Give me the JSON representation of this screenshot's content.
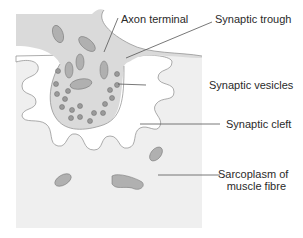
{
  "diagram": {
    "type": "neuromuscular-junction",
    "colors": {
      "background": "#ffffff",
      "muscle_fibre": "#efefef",
      "axon_terminal": "#dadada",
      "cleft": "#ffffff",
      "outline": "#8a8a8a",
      "mitochondrion": "#b0b0b0",
      "vesicle": "#9a9a9a",
      "leader_line": "#555555"
    },
    "labels": {
      "axon_terminal": "Axon terminal",
      "synaptic_trough": "Synaptic trough",
      "synaptic_vesicles": "Synaptic vesicles",
      "synaptic_cleft": "Synaptic cleft",
      "sarcoplasm_line1": "Sarcoplasm of",
      "sarcoplasm_line2": "muscle fibre"
    }
  }
}
